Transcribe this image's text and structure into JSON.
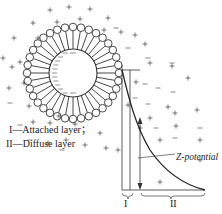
{
  "diagram": {
    "legend": [
      {
        "symbol": "I",
        "text": "—Attached layer；"
      },
      {
        "symbol": "II",
        "text": "—Diffuse layer"
      }
    ],
    "annotation": "Z-potential",
    "axis_labels": {
      "layer1": "I",
      "layer2": "II"
    },
    "colors": {
      "line": "#333333",
      "curve": "#222222"
    }
  }
}
